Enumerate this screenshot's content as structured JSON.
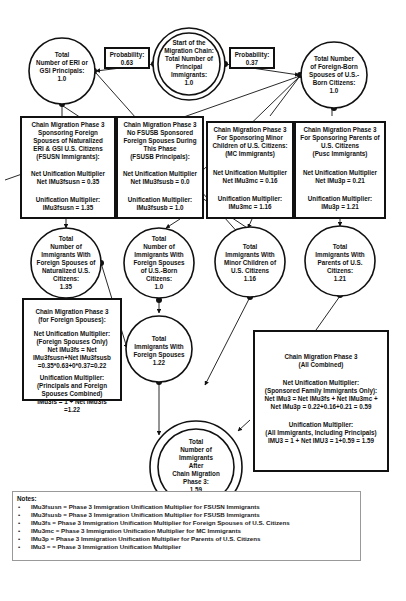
{
  "diagram": {
    "start_node": {
      "label": "Start of the\nMigration Chain:\nTotal Number of\nPrincipal\nImmigrants:\n1.0"
    },
    "probabilities": {
      "left": "Probability:\n0.63",
      "right": "Probability:\n0.37"
    },
    "nodes": {
      "eri_gsi_principals": "Total\nNumber of ERI or\nGSI Principals:\n1.0",
      "foreign_born_spouses": "Total Number\nof Foreign-Born\nSpouses of U.S.-\nBorn Citizens:\n1.0",
      "fs_naturalized": "Total\nNumber of\nImmigrants With\nForeign Spouses of\nNaturalized U.S.\nCitizens:\n1.35",
      "fs_us_born": "Total\nNumber of\nImmigrants With\nForeign Spouses\nof U.S.-Born\nCitizens:\n1.0",
      "minor_children": "Total\nImmigrants With\nMinor Children of\nU.S. Citizens\n1.16",
      "parents": "Total\nImmigrants With\nParents of U.S.\nCitizens:\n1.21",
      "foreign_spouses": "Total\nImmigrants With\nForeign Spouses\n1.22",
      "total_after": "Total\nNumber of\nImmigrants\nAfter\nChain Migration\nPhase 3:\n1.59"
    },
    "boxes": {
      "fsusn": {
        "title": "Chain Migration Phase 3\nSponsoring Foreign\nSpouses of Naturalized\nERI & GSI U.S. Citizens\n(FSUSN Immigrants):",
        "net": "Net Unification Multiplier\nNet IMu3fsusn =  0.35",
        "mult": "Unification Multiplier:\nIMu3fsusn = 1.35"
      },
      "fsusb": {
        "title": "Chain Migration Phase 3\nNo FSUSB Sponsored\nForeign Spouses During\nThis Phase\n(FSUSB Principals):",
        "net": "Net Unification Multiplier\nNet IMu3fsusb = 0.0",
        "mult": "Unification Multiplier:\nIMu3fsusb = 1.0"
      },
      "mc": {
        "title": "Chain Migration Phase 3\nFor Sponsoring Minor\nChildren of U.S. Citizens:\n(MC Immigrants)",
        "net": "Net Unification Multiplier\nNet IMu3mc = 0.16",
        "mult": "Unification Multiplier:\nIMu3mc = 1.16"
      },
      "pusc": {
        "title": "Chain Migration Phase 3\nFor Sponsoring Parents of\nU.S. Citizens\n(Pusc Immigrants)",
        "net": "Net Unification Multiplier\nNet IMu3p = 0.21",
        "mult": "Unification Multiplier:\nIMu3p = 1.21"
      },
      "foreign_spouses": {
        "title": "Chain Migration Phase 3\n(for Foreign Spouses):",
        "net": "Net Unification Multiplier:\n(Foreign Spouses Only)\nNet IMu3fs = Net\nIMu3fsusn+Net IMu3fsusb\n=0.35*0.63+0*0.37=0.22",
        "mult": "Unification Multiplier:\n(Principals and Foreign\nSpouses Combined)\nIMu3fs = 1 + Net IMu3fs\n=1.22"
      },
      "all_combined": {
        "title": "Chain Migration Phase 3\n(All Combined)",
        "net": "Net Unification Multiplier:\n(Sponsored Family Immigrants Only):\nNet IMu3 = Net IMu3fs + Net IMu3mc +\nNet IMu3p = 0.22+0.16+0.21 = 0.59",
        "mult": "Unification Multiplier:\n(All Immigrants, Including Principals)\nIMU3 = 1 + Net IMU3 = 1+0.59 = 1.59"
      }
    }
  },
  "notes": {
    "title": "Notes:",
    "items": [
      "IMu3fsusn = Phase 3 Immigration Unification Multiplier for FSUSN Immigrants",
      "IMu3fsusb = Phase 3 Immigration Unification Multiplier for FSUSB Immigrants",
      "IMu3fs = Phase 3 Immigration Unification Multiplier for Foreign Spouses of U.S. Citizens",
      "IMu3mc = Phase 3 Immigration Unification Multiplier for MC Immigrants",
      "IMu3p = Phase 3 Immigration Unification Multiplier for Parents of U.S. Citizens",
      "IMu3 = = Phase 3 Immigration Unification Multiplier"
    ]
  }
}
